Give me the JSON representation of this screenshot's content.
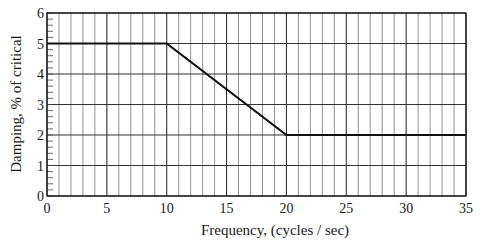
{
  "chart_data": {
    "type": "line",
    "title": "",
    "xlabel": "Frequency,  (cycles / sec)",
    "ylabel": "Damping,  % of critical",
    "xlim": [
      0,
      35
    ],
    "ylim": [
      0,
      6
    ],
    "x_ticks": [
      0,
      5,
      10,
      15,
      20,
      25,
      30,
      35
    ],
    "y_ticks": [
      0,
      1,
      2,
      3,
      4,
      5,
      6
    ],
    "x_tick_labels": [
      "0",
      "5",
      "10",
      "15",
      "20",
      "25",
      "30",
      "35"
    ],
    "y_tick_labels": [
      "0",
      "1",
      "2",
      "3",
      "4",
      "5",
      "6"
    ],
    "grid": true,
    "grid_x_minor_step": 1,
    "grid_y_major_step": 1,
    "y_minor_tick_step": 0.2,
    "legend": null,
    "series": [
      {
        "name": "Damping",
        "x": [
          0,
          10,
          20,
          35
        ],
        "y": [
          5,
          5,
          2,
          2
        ],
        "color": "#1a1a1a"
      }
    ]
  }
}
